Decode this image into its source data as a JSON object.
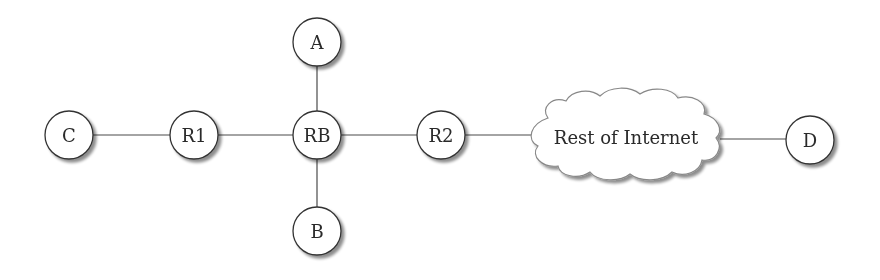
{
  "diagram": {
    "type": "network-topology",
    "nodes": [
      {
        "id": "C",
        "label": "C",
        "kind": "host",
        "x": 69,
        "y": 135
      },
      {
        "id": "R1",
        "label": "R1",
        "kind": "router",
        "x": 194,
        "y": 135
      },
      {
        "id": "A",
        "label": "A",
        "kind": "host",
        "x": 317,
        "y": 42
      },
      {
        "id": "RB",
        "label": "RB",
        "kind": "router",
        "x": 317,
        "y": 135
      },
      {
        "id": "B",
        "label": "B",
        "kind": "host",
        "x": 317,
        "y": 231
      },
      {
        "id": "R2",
        "label": "R2",
        "kind": "router",
        "x": 441,
        "y": 135
      },
      {
        "id": "D",
        "label": "D",
        "kind": "host",
        "x": 810,
        "y": 140
      }
    ],
    "cloud": {
      "id": "internet",
      "label": "Rest of Internet",
      "x": 626,
      "y": 137
    },
    "edges": [
      [
        "C",
        "R1"
      ],
      [
        "R1",
        "RB"
      ],
      [
        "A",
        "RB"
      ],
      [
        "RB",
        "B"
      ],
      [
        "RB",
        "R2"
      ],
      [
        "R2",
        "internet"
      ],
      [
        "internet",
        "D"
      ]
    ]
  }
}
